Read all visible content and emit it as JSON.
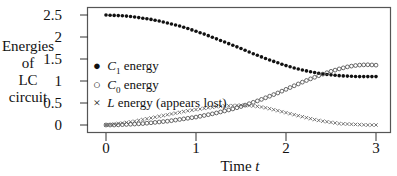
{
  "chart_data": {
    "type": "scatter",
    "title": "",
    "xlabel": "Time t",
    "xlabel_parts": {
      "text": "Time",
      "var": "t"
    },
    "ylabel": "Energies of LC circuit",
    "ylabel_lines": [
      "Energies",
      "of",
      "LC",
      "circuit"
    ],
    "xlim": [
      0,
      3
    ],
    "ylim": [
      0,
      2.5
    ],
    "xticks": [
      "0",
      "1",
      "2",
      "3"
    ],
    "yticks": [
      "0",
      "0.5",
      "1",
      "1.5",
      "2",
      "2.5"
    ],
    "grid": false,
    "legend_position": "center-left inside",
    "series": [
      {
        "name": "C1 energy",
        "legend": {
          "symbol": "●",
          "var": "C",
          "sub": "1",
          "text": "energy"
        },
        "marker": "filled-circle",
        "x": [
          0,
          0.1,
          0.2,
          0.3,
          0.4,
          0.5,
          0.6,
          0.7,
          0.8,
          0.9,
          1.0,
          1.1,
          1.2,
          1.3,
          1.4,
          1.5,
          1.6,
          1.7,
          1.8,
          1.9,
          2.0,
          2.1,
          2.2,
          2.3,
          2.4,
          2.5,
          2.6,
          2.7,
          2.8,
          2.9,
          3.0
        ],
        "values": [
          2.5,
          2.49,
          2.48,
          2.46,
          2.43,
          2.4,
          2.36,
          2.31,
          2.26,
          2.2,
          2.13,
          2.06,
          1.98,
          1.9,
          1.82,
          1.74,
          1.65,
          1.57,
          1.49,
          1.42,
          1.35,
          1.29,
          1.24,
          1.2,
          1.16,
          1.14,
          1.12,
          1.11,
          1.1,
          1.1,
          1.1
        ]
      },
      {
        "name": "C0 energy",
        "legend": {
          "symbol": "○",
          "var": "C",
          "sub": "0",
          "text": "energy"
        },
        "marker": "open-circle",
        "x": [
          0,
          0.1,
          0.2,
          0.3,
          0.4,
          0.5,
          0.6,
          0.7,
          0.8,
          0.9,
          1.0,
          1.1,
          1.2,
          1.3,
          1.4,
          1.5,
          1.6,
          1.7,
          1.8,
          1.9,
          2.0,
          2.1,
          2.2,
          2.3,
          2.4,
          2.5,
          2.6,
          2.7,
          2.8,
          2.9,
          3.0
        ],
        "values": [
          0.0,
          0.0,
          0.01,
          0.02,
          0.03,
          0.05,
          0.07,
          0.09,
          0.12,
          0.15,
          0.18,
          0.22,
          0.26,
          0.31,
          0.36,
          0.42,
          0.49,
          0.56,
          0.64,
          0.72,
          0.81,
          0.9,
          0.99,
          1.07,
          1.15,
          1.22,
          1.28,
          1.33,
          1.36,
          1.37,
          1.36
        ]
      },
      {
        "name": "L energy (appears lost)",
        "legend": {
          "symbol": "×",
          "var": "L",
          "sub": "",
          "text": "energy (appears lost)"
        },
        "marker": "x",
        "x": [
          0,
          0.1,
          0.2,
          0.3,
          0.4,
          0.5,
          0.6,
          0.7,
          0.8,
          0.9,
          1.0,
          1.1,
          1.2,
          1.3,
          1.4,
          1.5,
          1.6,
          1.7,
          1.8,
          1.9,
          2.0,
          2.1,
          2.2,
          2.3,
          2.4,
          2.5,
          2.6,
          2.7,
          2.8,
          2.9,
          3.0
        ],
        "values": [
          0.0,
          0.02,
          0.05,
          0.08,
          0.12,
          0.16,
          0.2,
          0.24,
          0.28,
          0.32,
          0.35,
          0.38,
          0.41,
          0.43,
          0.44,
          0.45,
          0.44,
          0.42,
          0.38,
          0.33,
          0.28,
          0.23,
          0.18,
          0.13,
          0.09,
          0.06,
          0.03,
          0.02,
          0.01,
          0.0,
          0.0
        ]
      }
    ]
  }
}
